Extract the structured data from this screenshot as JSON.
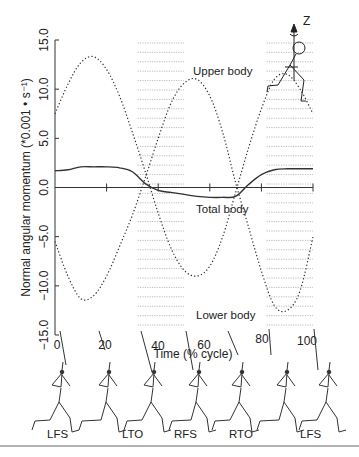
{
  "chart_data": {
    "type": "line",
    "title": "",
    "xlabel": "Time (% cycle)",
    "ylabel": "Normal angular momentum (*0.001 • s⁻¹)",
    "xlim": [
      0,
      100
    ],
    "ylim": [
      -15,
      15
    ],
    "x_ticks": [
      "0",
      "20",
      "40",
      "60",
      "80",
      "100"
    ],
    "y_ticks": [
      "15.0",
      "10.0",
      "5.0",
      "0.0",
      "−5.0",
      "−10.0",
      "−15.0"
    ],
    "grid": false,
    "shaded_regions": [
      [
        32,
        50
      ],
      [
        82,
        100
      ]
    ],
    "x": [
      0,
      5,
      10,
      15,
      20,
      25,
      30,
      35,
      40,
      45,
      50,
      55,
      60,
      65,
      70,
      75,
      80,
      85,
      90,
      95,
      100
    ],
    "series": [
      {
        "name": "Upper body",
        "style": "dotted",
        "values": [
          7.5,
          10.5,
          12.7,
          13.3,
          12.0,
          9.3,
          5.6,
          1.6,
          -2.6,
          -6.2,
          -8.4,
          -9.0,
          -8.0,
          -5.0,
          -0.5,
          4.0,
          8.0,
          11.0,
          11.5,
          10.0,
          7.5
        ]
      },
      {
        "name": "Total body",
        "style": "solid",
        "values": [
          1.7,
          1.8,
          2.1,
          2.1,
          2.1,
          2.0,
          1.6,
          0.4,
          -0.3,
          -0.5,
          -0.7,
          -0.9,
          -1.0,
          -1.0,
          -0.9,
          0.3,
          1.3,
          1.8,
          1.9,
          1.9,
          1.9
        ]
      },
      {
        "name": "Lower body",
        "style": "dotted",
        "values": [
          -5.5,
          -9.0,
          -11.3,
          -11.0,
          -9.0,
          -6.0,
          -2.8,
          1.0,
          5.0,
          8.6,
          10.6,
          11.0,
          9.3,
          5.6,
          0.5,
          -4.0,
          -8.5,
          -12.0,
          -12.5,
          -10.5,
          -5.0
        ]
      }
    ],
    "annotations": [
      "Upper body",
      "Total body",
      "Lower body",
      "Z"
    ],
    "gait_events": [
      {
        "label": "LFS",
        "x": 3
      },
      {
        "label": "LTO",
        "x": 40
      },
      {
        "label": "RFS",
        "x": 56
      },
      {
        "label": "RTO",
        "x": 85
      },
      {
        "label": "LFS",
        "x": 97
      }
    ]
  }
}
